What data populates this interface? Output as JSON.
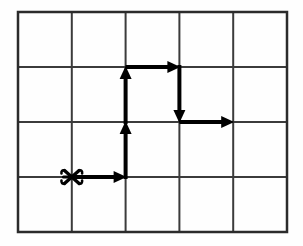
{
  "figure": {
    "name": "grid-path-diagram",
    "background_color": "#fefefe"
  },
  "grid": {
    "name": "lattice-grid",
    "columns": 5,
    "rows": 4,
    "x_start": 18,
    "y_start": 12,
    "cell_width": 53.8,
    "cell_height": 55,
    "line_color": "#3b3b3b",
    "line_width": 2,
    "border_color": "#2b2b2b",
    "border_width": 2.5,
    "vertical_line_x": [
      18,
      71.8,
      125.6,
      179.4,
      233.2,
      287
    ],
    "horizontal_line_y": [
      12,
      67,
      122,
      177,
      232
    ]
  },
  "start_marker": {
    "name": "start-point-marker",
    "glyph": "x-asterisk-marker",
    "x": 71.8,
    "y": 177,
    "color": "#000000",
    "size": 17
  },
  "path": {
    "name": "arrow-path",
    "color": "#000000",
    "stroke_width": 4,
    "arrowhead_length": 13,
    "arrowhead_width": 12,
    "segments": [
      {
        "name": "segment-right-1",
        "direction": "right",
        "x1": 71.8,
        "y1": 177,
        "x2": 125.6,
        "y2": 177
      },
      {
        "name": "segment-up-1",
        "direction": "up",
        "x1": 125.6,
        "y1": 177,
        "x2": 125.6,
        "y2": 122
      },
      {
        "name": "segment-up-2",
        "direction": "up",
        "x1": 125.6,
        "y1": 122,
        "x2": 125.6,
        "y2": 67
      },
      {
        "name": "segment-right-2",
        "direction": "right",
        "x1": 125.6,
        "y1": 67,
        "x2": 179.4,
        "y2": 67
      },
      {
        "name": "segment-down-1",
        "direction": "down",
        "x1": 179.4,
        "y1": 67,
        "x2": 179.4,
        "y2": 122
      },
      {
        "name": "segment-right-3",
        "direction": "right",
        "x1": 179.4,
        "y1": 122,
        "x2": 233.2,
        "y2": 122
      }
    ]
  },
  "chart_data": {
    "type": "scatter",
    "title": "",
    "xlabel": "",
    "ylabel": "",
    "grid": true,
    "xlim": [
      0,
      5
    ],
    "ylim": [
      0,
      4
    ],
    "annotations": [
      "start marker at lattice point (1, 1)",
      "path: right 1, up 2, right 1, down 1, right 1"
    ],
    "lattice_path_steps": [
      "R",
      "U",
      "U",
      "R",
      "D",
      "R"
    ],
    "lattice_points": [
      [
        1,
        1
      ],
      [
        2,
        1
      ],
      [
        2,
        2
      ],
      [
        2,
        3
      ],
      [
        3,
        3
      ],
      [
        3,
        2
      ],
      [
        4,
        2
      ]
    ]
  }
}
